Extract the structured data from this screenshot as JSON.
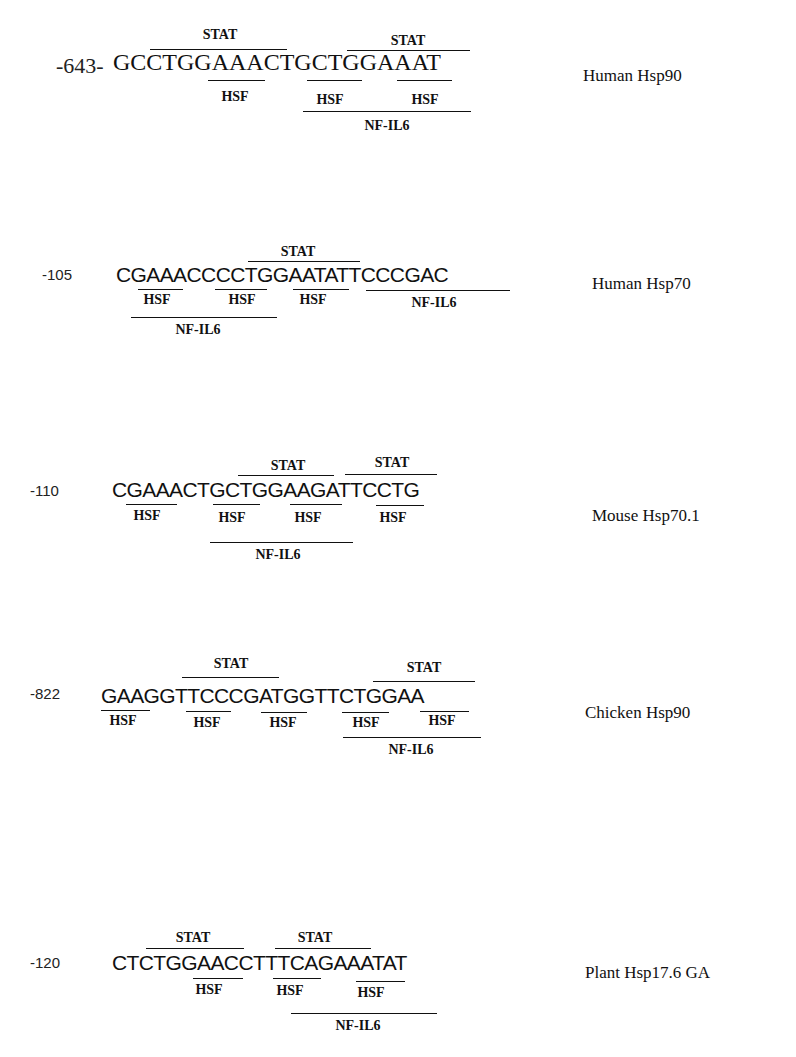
{
  "figure": {
    "rows": [
      {
        "position": "-643-",
        "sequence": "GCCTGGAAACTGCTGGAAAT",
        "gene": "Human Hsp90",
        "stat_labels": [
          "STAT",
          "STAT"
        ],
        "hsf_labels": [
          "HSF",
          "HSF",
          "HSF"
        ],
        "nfil6_labels": [
          "NF-IL6"
        ]
      },
      {
        "position": "-105",
        "sequence": "CGAAACCCCTGGAATATTCCCGAC",
        "gene": "Human Hsp70",
        "stat_labels": [
          "STAT"
        ],
        "hsf_labels": [
          "HSF",
          "HSF",
          "HSF"
        ],
        "nfil6_labels": [
          "NF-IL6",
          "NF-IL6"
        ]
      },
      {
        "position": "-110",
        "sequence": "CGAAACTGCTGGAAGATTCCTG",
        "gene": "Mouse Hsp70.1",
        "stat_labels": [
          "STAT",
          "STAT"
        ],
        "hsf_labels": [
          "HSF",
          "HSF",
          "HSF",
          "HSF"
        ],
        "nfil6_labels": [
          "NF-IL6"
        ]
      },
      {
        "position": "-822",
        "sequence": "GAAGGTTCCCGATGGTTCTGGAA",
        "gene": "Chicken Hsp90",
        "stat_labels": [
          "STAT",
          "STAT"
        ],
        "hsf_labels": [
          "HSF",
          "HSF",
          "HSF",
          "HSF",
          "HSF"
        ],
        "nfil6_labels": [
          "NF-IL6"
        ]
      },
      {
        "position": "-120",
        "sequence": "CTCTGGAACCTTTCAGAAATAT",
        "gene": "Plant Hsp17.6 GA",
        "stat_labels": [
          "STAT",
          "STAT"
        ],
        "hsf_labels": [
          "HSF",
          "HSF",
          "HSF"
        ],
        "nfil6_labels": [
          "NF-IL6"
        ]
      }
    ]
  }
}
